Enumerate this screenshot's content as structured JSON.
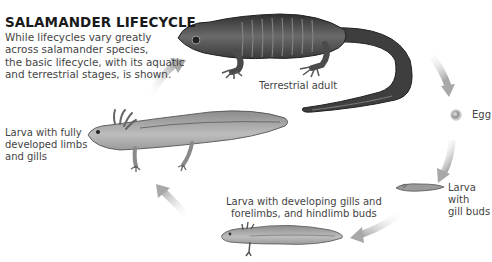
{
  "title": "SALAMANDER LIFECYCLE",
  "intro": {
    "line1": "While lifecycles vary greatly",
    "line2": "across salamander species,",
    "line3": "the basic lifecycle, with its aquatic",
    "line4": "and terrestrial stages, is shown."
  },
  "stages": {
    "adult": {
      "label": "Terrestrial adult"
    },
    "egg": {
      "label": "Egg"
    },
    "gill_buds": {
      "line1": "Larva with",
      "line2": "gill buds"
    },
    "developing": {
      "line1": "Larva with developing gills and",
      "line2": "forelimbs, and hindlimb buds"
    },
    "full": {
      "line1": "Larva with fully",
      "line2": "developed limbs",
      "line3": "and gills"
    }
  },
  "colors": {
    "arrow": "#b5b5b5",
    "adult_body": "#4a4a4a",
    "larva_body": "#a9a9a9"
  }
}
